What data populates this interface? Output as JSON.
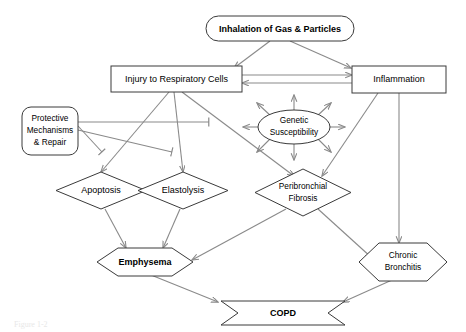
{
  "figure": {
    "caption": "Figure 1-2",
    "colors": {
      "shape_stroke": "#3a3a3a",
      "connector_stroke": "#8a8a8a",
      "background": "#ffffff",
      "text": "#000000"
    }
  },
  "nodes": {
    "inhalation": {
      "label": "Inhalation of Gas & Particles",
      "shape": "rounded-rectangle",
      "bold": true
    },
    "injury": {
      "label": "Injury to Respiratory Cells",
      "shape": "rectangle",
      "bold": false
    },
    "inflammation": {
      "label": "Inflammation",
      "shape": "rectangle",
      "bold": false
    },
    "protective": {
      "label_line1": "Protective",
      "label_line2": "Mechanisms",
      "label_line3": "& Repair",
      "shape": "rounded-rectangle",
      "bold": false
    },
    "genetic": {
      "label_line1": "Genetic",
      "label_line2": "Susceptibility",
      "shape": "ellipse",
      "bold": false
    },
    "apoptosis": {
      "label": "Apoptosis",
      "shape": "diamond",
      "bold": false
    },
    "elastolysis": {
      "label": "Elastolysis",
      "shape": "diamond",
      "bold": false
    },
    "fibrosis": {
      "label_line1": "Peribronchial",
      "label_line2": "Fibrosis",
      "shape": "diamond",
      "bold": false
    },
    "emphysema": {
      "label": "Emphysema",
      "shape": "hexagon",
      "bold": true
    },
    "bronchitis": {
      "label_line1": "Chronic",
      "label_line2": "Bronchitis",
      "shape": "hexagon",
      "bold": false
    },
    "copd": {
      "label": "COPD",
      "shape": "banner",
      "bold": true
    }
  },
  "edges": [
    {
      "from": "inhalation",
      "to": "injury",
      "type": "arrow"
    },
    {
      "from": "inhalation",
      "to": "inflammation",
      "type": "arrow"
    },
    {
      "from": "injury",
      "to": "inflammation",
      "type": "arrow"
    },
    {
      "from": "inflammation",
      "to": "injury",
      "type": "arrow"
    },
    {
      "from": "injury",
      "to": "apoptosis",
      "type": "arrow"
    },
    {
      "from": "injury",
      "to": "elastolysis",
      "type": "arrow"
    },
    {
      "from": "injury",
      "to": "fibrosis",
      "type": "arrow"
    },
    {
      "from": "protective",
      "to": "apoptosis",
      "type": "inhibit"
    },
    {
      "from": "protective",
      "to": "elastolysis",
      "type": "inhibit"
    },
    {
      "from": "protective",
      "to": "fibrosis",
      "type": "inhibit"
    },
    {
      "from": "apoptosis",
      "to": "emphysema",
      "type": "arrow"
    },
    {
      "from": "elastolysis",
      "to": "emphysema",
      "type": "arrow"
    },
    {
      "from": "fibrosis",
      "to": "emphysema",
      "type": "arrow"
    },
    {
      "from": "fibrosis",
      "to": "bronchitis",
      "type": "arrow"
    },
    {
      "from": "inflammation",
      "to": "fibrosis",
      "type": "arrow"
    },
    {
      "from": "inflammation",
      "to": "bronchitis",
      "type": "arrow"
    },
    {
      "from": "emphysema",
      "to": "copd",
      "type": "arrow"
    },
    {
      "from": "bronchitis",
      "to": "copd",
      "type": "arrow"
    },
    {
      "from": "genetic",
      "to": "radial",
      "type": "arrow",
      "count": 8
    }
  ]
}
